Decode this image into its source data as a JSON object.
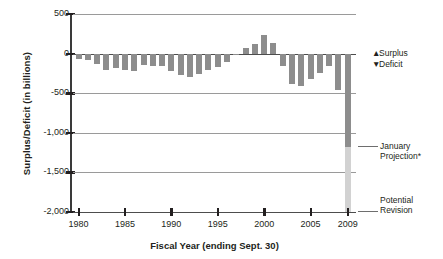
{
  "chart_data": {
    "type": "bar",
    "title": "",
    "xlabel": "Fiscal Year (ending Sept. 30)",
    "ylabel": "Surplus/Deficit (in billions)",
    "ylim": [
      -2000,
      500
    ],
    "yticks": [
      500,
      0,
      -500,
      -1000,
      -1500,
      -2000
    ],
    "ytick_labels": [
      "500",
      "0",
      "-500",
      "-1,000",
      "-1,500",
      "-2,000"
    ],
    "xticks": [
      1980,
      1985,
      1990,
      1995,
      2000,
      2005,
      2009
    ],
    "xtick_labels": [
      "1980",
      "1985",
      "1990",
      "1995",
      "2000",
      "2005",
      "2009"
    ],
    "grid": true,
    "legend_position": "right",
    "categories": [
      1980,
      1981,
      1982,
      1983,
      1984,
      1985,
      1986,
      1987,
      1988,
      1989,
      1990,
      1991,
      1992,
      1993,
      1994,
      1995,
      1996,
      1997,
      1998,
      1999,
      2000,
      2001,
      2002,
      2003,
      2004,
      2005,
      2006,
      2007,
      2008,
      2009
    ],
    "values": [
      -74,
      -79,
      -128,
      -208,
      -185,
      -212,
      -221,
      -150,
      -155,
      -153,
      -221,
      -269,
      -290,
      -255,
      -203,
      -164,
      -107,
      -22,
      69,
      126,
      236,
      128,
      -158,
      -378,
      -413,
      -318,
      -248,
      -161,
      -459,
      -1180
    ],
    "series": [
      {
        "name": "Surplus/Deficit",
        "values": [
          -74,
          -79,
          -128,
          -208,
          -185,
          -212,
          -221,
          -150,
          -155,
          -153,
          -221,
          -269,
          -290,
          -255,
          -203,
          -164,
          -107,
          -22,
          69,
          126,
          236,
          128,
          -158,
          -378,
          -413,
          -318,
          -248,
          -161,
          -459,
          -1180
        ]
      },
      {
        "name": "Potential Revision",
        "values": [
          null,
          null,
          null,
          null,
          null,
          null,
          null,
          null,
          null,
          null,
          null,
          null,
          null,
          null,
          null,
          null,
          null,
          null,
          null,
          null,
          null,
          null,
          null,
          null,
          null,
          null,
          null,
          null,
          null,
          -2000
        ]
      }
    ],
    "annotations": [
      {
        "label": "January Projection*",
        "year": 2009,
        "value": -1180
      },
      {
        "label": "Potential Revision",
        "year": 2009,
        "value": -2000
      }
    ],
    "colors": {
      "bar": "#8d8d8d",
      "revision": "#d2d2d2",
      "axis": "#231f20",
      "grid": "#9a9a9a"
    }
  },
  "legend": {
    "surplus_marker": "▲",
    "surplus_label": "Surplus",
    "deficit_marker": "▼",
    "deficit_label": "Deficit"
  },
  "annotations": {
    "january_line1": "January",
    "january_line2": "Projection*",
    "potential_line1": "Potential",
    "potential_line2": "Revision"
  }
}
